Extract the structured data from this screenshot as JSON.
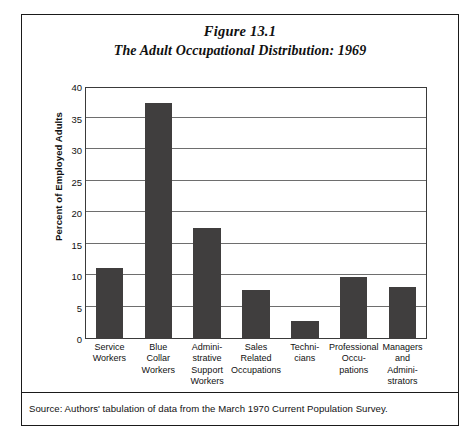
{
  "figure": {
    "title": "Figure 13.1",
    "subtitle": "The Adult Occupational Distribution: 1969",
    "source": "Source: Authors' tabulation of data from the March 1970 Current Population Survey."
  },
  "chart_data": {
    "type": "bar",
    "title": "The Adult Occupational Distribution: 1969",
    "xlabel": "",
    "ylabel": "Percent of Employed Adults",
    "ylim": [
      0,
      40
    ],
    "ytick_step": 5,
    "yticks": [
      0,
      5,
      10,
      15,
      20,
      25,
      30,
      35,
      40
    ],
    "ytick_labels": [
      "0",
      "5",
      "10",
      "15",
      "20",
      "25",
      "30",
      "35",
      "40"
    ],
    "grid": true,
    "legend": false,
    "bar_color": "#403E3E",
    "categories": [
      "Service Workers",
      "Blue Collar Workers",
      "Administrative Support Workers",
      "Sales Related Occupations",
      "Technicians",
      "Professional Occupations",
      "Managers and Administrators"
    ],
    "category_label_lines": [
      [
        "Service",
        "Workers"
      ],
      [
        "Blue",
        "Collar",
        "Workers"
      ],
      [
        "Admini-",
        "strative",
        "Support",
        "Workers"
      ],
      [
        "Sales",
        "Related",
        "Occupations"
      ],
      [
        "Techni-",
        "cians"
      ],
      [
        "Professional",
        "Occu-",
        "pations"
      ],
      [
        "Managers",
        "and",
        "Admini-",
        "strators"
      ]
    ],
    "values": [
      11.3,
      37.4,
      17.7,
      7.8,
      2.8,
      9.8,
      8.2
    ]
  }
}
